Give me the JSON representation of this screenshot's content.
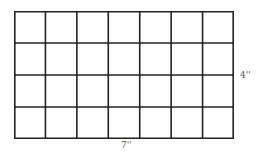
{
  "diagram": {
    "type": "grid-rectangle",
    "columns": 7,
    "rows": 4,
    "line_color": "#222222",
    "labels": {
      "height": "4''",
      "width": "7''"
    }
  }
}
